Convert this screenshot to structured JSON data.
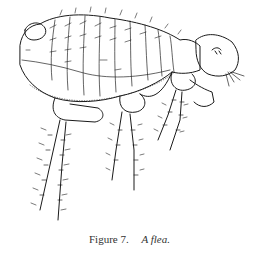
{
  "figure": {
    "caption": {
      "label": "Figure 7.",
      "title": "A flea."
    }
  }
}
